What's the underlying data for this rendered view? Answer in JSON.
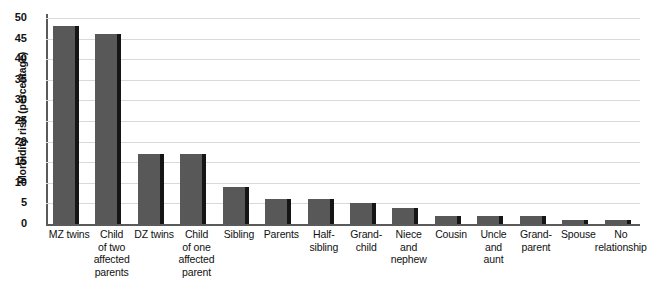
{
  "chart_data": {
    "type": "bar",
    "title": "",
    "xlabel": "",
    "ylabel": "Morbidity risk (percentage)",
    "ylim": [
      0,
      50
    ],
    "yticks": [
      0,
      5,
      10,
      15,
      20,
      25,
      30,
      35,
      40,
      45,
      50
    ],
    "grid": true,
    "legend": false,
    "bar_color": "#585858",
    "bar_edge_color": "#151515",
    "gridline_color": "#d9d9d9",
    "axis_color": "#5a5a5a",
    "categories": [
      "MZ twins",
      "Child of two affected parents",
      "DZ twins",
      "Child of one affected parent",
      "Sibling",
      "Parents",
      "Half-sibling",
      "Grandchild",
      "Niece and nephew",
      "Cousin",
      "Uncle and aunt",
      "Grandparent",
      "Spouse",
      "No relationship"
    ],
    "category_label_lines": [
      [
        "MZ twins"
      ],
      [
        "Child",
        "of two",
        "affected",
        "parents"
      ],
      [
        "DZ twins"
      ],
      [
        "Child",
        "of one",
        "affected",
        "parent"
      ],
      [
        "Sibling"
      ],
      [
        "Parents"
      ],
      [
        "Half-",
        "sibling"
      ],
      [
        "Grand-",
        "child"
      ],
      [
        "Niece",
        "and",
        "nephew"
      ],
      [
        "Cousin"
      ],
      [
        "Uncle",
        "and",
        "aunt"
      ],
      [
        "Grand-",
        "parent"
      ],
      [
        "Spouse"
      ],
      [
        "No",
        "relationship"
      ]
    ],
    "values": [
      48,
      46,
      17,
      17,
      9,
      6,
      6,
      5,
      4,
      2,
      2,
      2,
      1,
      1
    ]
  }
}
